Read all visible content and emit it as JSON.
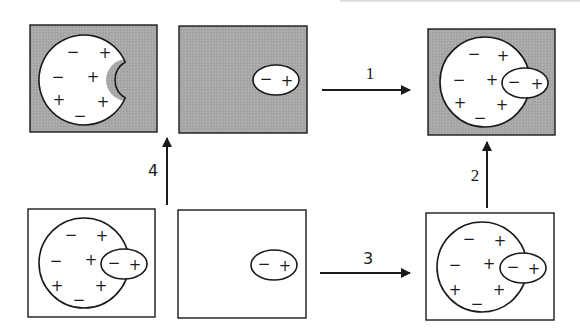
{
  "colors": {
    "gray_fill": "#a9a9a9",
    "stroke": "#1a1a1a",
    "white": "#ffffff"
  },
  "panels": [
    {
      "id": "top-left",
      "x": 30,
      "y": 25,
      "w": 127,
      "h": 107,
      "shaded": true,
      "cell": {
        "cx": 84,
        "cy": 80,
        "r": 45,
        "notch": {
          "cx": 127,
          "cy": 80,
          "r": 21
        }
      },
      "charges": [
        "−",
        "+",
        "−",
        "+",
        "+",
        "+",
        "−"
      ]
    },
    {
      "id": "top-middle",
      "x": 179,
      "y": 26,
      "w": 128,
      "h": 107,
      "shaded": true,
      "molecule": {
        "cx": 276,
        "cy": 80,
        "rx": 23,
        "ry": 15,
        "charges": [
          "−",
          "+"
        ]
      }
    },
    {
      "id": "top-right",
      "x": 428,
      "y": 29,
      "w": 127,
      "h": 106,
      "shaded": true,
      "cell": {
        "cx": 485,
        "cy": 82,
        "r": 45
      },
      "charges": [
        "−",
        "+",
        "−",
        "+",
        "+",
        "+",
        "−"
      ],
      "molecule": {
        "cx": 525,
        "cy": 83,
        "rx": 23,
        "ry": 15,
        "charges": [
          "−",
          "+"
        ]
      }
    },
    {
      "id": "bottom-left",
      "x": 28,
      "y": 209,
      "w": 127,
      "h": 108,
      "shaded": false,
      "cell": {
        "cx": 84,
        "cy": 263,
        "r": 45
      },
      "charges": [
        "−",
        "+",
        "−",
        "+",
        "+",
        "+",
        "−"
      ],
      "molecule": {
        "cx": 124,
        "cy": 264,
        "rx": 23,
        "ry": 15,
        "charges": [
          "−",
          "+"
        ]
      }
    },
    {
      "id": "bottom-middle",
      "x": 178,
      "y": 210,
      "w": 128,
      "h": 108,
      "shaded": false,
      "molecule": {
        "cx": 274,
        "cy": 265,
        "rx": 23,
        "ry": 15,
        "charges": [
          "−",
          "+"
        ]
      }
    },
    {
      "id": "bottom-right",
      "x": 426,
      "y": 213,
      "w": 128,
      "h": 107,
      "shaded": false,
      "cell": {
        "cx": 482,
        "cy": 267,
        "r": 45
      },
      "charges": [
        "−",
        "+",
        "−",
        "+",
        "+",
        "+",
        "−"
      ],
      "molecule": {
        "cx": 523,
        "cy": 268,
        "rx": 23,
        "ry": 15,
        "charges": [
          "−",
          "+"
        ]
      }
    }
  ],
  "arrows": [
    {
      "label": "1",
      "direction": "right",
      "from": [
        322,
        90
      ],
      "to": [
        410,
        90
      ],
      "label_pos": [
        370,
        73
      ],
      "label_style": "serif"
    },
    {
      "label": "2",
      "direction": "up",
      "from": [
        487,
        208
      ],
      "to": [
        487,
        142
      ],
      "label_pos": [
        475,
        175
      ],
      "label_style": "serif"
    },
    {
      "label": "3",
      "direction": "right",
      "from": [
        320,
        273
      ],
      "to": [
        410,
        273
      ],
      "label_pos": [
        368,
        258
      ],
      "label_style": "sans"
    },
    {
      "label": "4",
      "direction": "up",
      "from": [
        167,
        205
      ],
      "to": [
        167,
        138
      ],
      "label_pos": [
        153,
        170
      ],
      "label_style": "sans"
    }
  ],
  "labels": {
    "arrow1": "1",
    "arrow2": "2",
    "arrow3": "3",
    "arrow4": "4",
    "minus": "−",
    "plus": "+"
  }
}
